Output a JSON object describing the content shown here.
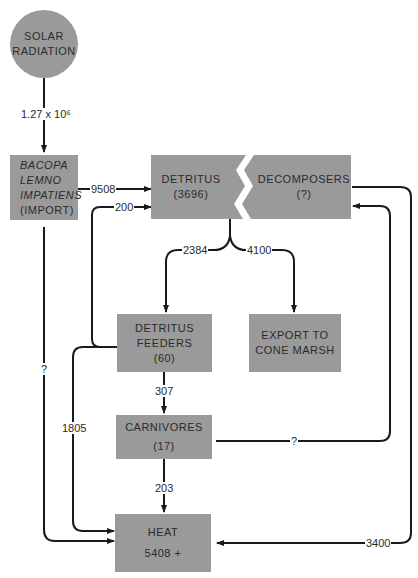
{
  "nodes": {
    "solar": {
      "line1": "SOLAR",
      "line2": "RADIATION"
    },
    "import": {
      "line1": "BACOPA",
      "line2": "LEMNO",
      "line3": "IMPATIENS",
      "line4": "(IMPORT)"
    },
    "detritus": {
      "line1": "DETRITUS",
      "line2": "(3696)"
    },
    "decomposers": {
      "line1": "DECOMPOSERS",
      "line2": "(?)"
    },
    "detritus_feeders": {
      "line1": "DETRITUS",
      "line2": "FEEDERS",
      "line3": "(60)"
    },
    "export": {
      "line1": "EXPORT TO",
      "line2": "CONE MARSH"
    },
    "carnivores": {
      "line1": "CARNIVORES",
      "line2": "(17)"
    },
    "heat": {
      "line1": "HEAT",
      "line2": "5408 +"
    }
  },
  "flows": {
    "solar_to_import": "1.27 x 10⁶",
    "import_to_detritus": "9508",
    "feeders_to_detritus": "200",
    "detritus_to_feeders": "2384",
    "detritus_to_export": "4100",
    "feeders_to_carnivores": "307",
    "feeders_to_heat": "1805",
    "import_to_heat": "?",
    "carnivores_to_decomposers": "?",
    "carnivores_to_heat": "203",
    "decomposers_to_heat": "3400"
  },
  "colors": {
    "box": "#9a9a9a",
    "line": "#1a1a1a",
    "background": "#ffffff"
  }
}
